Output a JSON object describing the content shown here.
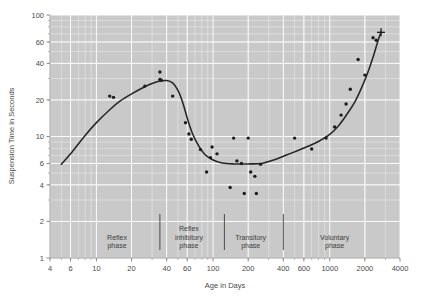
{
  "chart_data": {
    "type": "scatter",
    "title": "",
    "xlabel": "Age in Days",
    "ylabel": "Suspension Time in Seconds",
    "xscale": "log",
    "yscale": "log",
    "xlim": [
      4,
      4000
    ],
    "ylim": [
      1,
      100
    ],
    "grid": true,
    "legend": null,
    "xticks": [
      4,
      6,
      10,
      20,
      40,
      60,
      100,
      200,
      400,
      600,
      1000,
      2000,
      4000
    ],
    "xtick_labels": [
      "4",
      "6",
      "10",
      "20",
      "40",
      "60",
      "100",
      "200",
      "400",
      "600",
      "1000",
      "2000",
      "4000"
    ],
    "yticks": [
      1,
      2,
      4,
      6,
      10,
      20,
      40,
      60,
      100
    ],
    "ytick_labels": [
      "1",
      "2",
      "4",
      "6",
      "10",
      "20",
      "40",
      "60",
      "100"
    ],
    "annotations": [
      {
        "text": "Reflex phase",
        "lines": [
          "Reflex",
          "phase"
        ],
        "x_center": 15,
        "x_start": 4,
        "x_end": 35
      },
      {
        "text": "Reflex inhibitory phase",
        "lines": [
          "Reflex",
          "inhibitory",
          "phase"
        ],
        "x_center": 62,
        "x_start": 35,
        "x_end": 125
      },
      {
        "text": "Transitory phase",
        "lines": [
          "Transitory",
          "phase"
        ],
        "x_center": 210,
        "x_start": 125,
        "x_end": 400
      },
      {
        "text": "Voluntary phase",
        "lines": [
          "Voluntary",
          "phase"
        ],
        "x_center": 1100,
        "x_start": 400,
        "x_end": 4000
      }
    ],
    "phase_dividers": [
      35,
      125,
      400
    ],
    "series": [
      {
        "name": "Suspension time observations",
        "marker": "dot",
        "points": [
          [
            13,
            21.5
          ],
          [
            14,
            21.0
          ],
          [
            26,
            26.0
          ],
          [
            35,
            34.0
          ],
          [
            35,
            29.5
          ],
          [
            36,
            29.0
          ],
          [
            45,
            21.5
          ],
          [
            58,
            13.0
          ],
          [
            62,
            10.5
          ],
          [
            65,
            9.5
          ],
          [
            78,
            7.8
          ],
          [
            88,
            5.1
          ],
          [
            95,
            6.7
          ],
          [
            98,
            8.2
          ],
          [
            108,
            7.2
          ],
          [
            140,
            3.8
          ],
          [
            150,
            9.7
          ],
          [
            160,
            6.3
          ],
          [
            175,
            6.0
          ],
          [
            185,
            3.4
          ],
          [
            200,
            9.7
          ],
          [
            210,
            5.1
          ],
          [
            228,
            4.7
          ],
          [
            235,
            3.4
          ],
          [
            255,
            5.9
          ],
          [
            500,
            9.7
          ],
          [
            700,
            7.9
          ],
          [
            930,
            9.7
          ],
          [
            1100,
            12.0
          ],
          [
            1250,
            15.0
          ],
          [
            1380,
            18.5
          ],
          [
            1500,
            24.5
          ],
          [
            1750,
            43.0
          ],
          [
            2000,
            32.0
          ],
          [
            2350,
            65.0
          ],
          [
            2500,
            62.0
          ]
        ]
      }
    ],
    "fit_curve": {
      "name": "Fitted trend",
      "points": [
        [
          5,
          5.9
        ],
        [
          6,
          7.2
        ],
        [
          8,
          10.2
        ],
        [
          10,
          13.0
        ],
        [
          13,
          16.6
        ],
        [
          16,
          19.6
        ],
        [
          20,
          22.4
        ],
        [
          25,
          25.2
        ],
        [
          30,
          27.3
        ],
        [
          35,
          28.6
        ],
        [
          40,
          28.9
        ],
        [
          45,
          27.6
        ],
        [
          50,
          24.0
        ],
        [
          55,
          19.0
        ],
        [
          60,
          14.2
        ],
        [
          66,
          10.8
        ],
        [
          75,
          8.4
        ],
        [
          85,
          7.1
        ],
        [
          100,
          6.4
        ],
        [
          120,
          6.05
        ],
        [
          150,
          5.95
        ],
        [
          200,
          5.95
        ],
        [
          260,
          6.0
        ],
        [
          330,
          6.4
        ],
        [
          420,
          7.0
        ],
        [
          520,
          7.6
        ],
        [
          650,
          8.3
        ],
        [
          800,
          9.1
        ],
        [
          1000,
          10.4
        ],
        [
          1200,
          12.4
        ],
        [
          1400,
          15.2
        ],
        [
          1650,
          19.5
        ],
        [
          1900,
          26.0
        ],
        [
          2150,
          35.0
        ],
        [
          2400,
          48.0
        ],
        [
          2600,
          62.0
        ],
        [
          2750,
          72.0
        ]
      ],
      "end_marker": "cross"
    },
    "colors": {
      "plot_background": "#c9c9c9",
      "figure_background": "#ffffff",
      "gridline": "#ffffff",
      "curve": "#262626",
      "marker": "#1c1c1c",
      "text": "#4a4a4a"
    }
  }
}
